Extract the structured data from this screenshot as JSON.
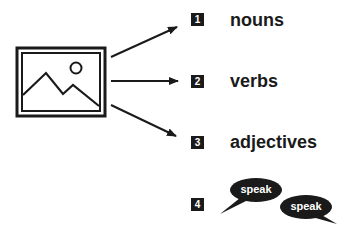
{
  "image_icon": "picture-icon",
  "items": [
    {
      "number": "1",
      "label": "nouns"
    },
    {
      "number": "2",
      "label": "verbs"
    },
    {
      "number": "3",
      "label": "adjectives"
    },
    {
      "number": "4",
      "bubbles": [
        "speak",
        "speak"
      ]
    }
  ],
  "colors": {
    "ink": "#1a1a1a",
    "background": "#ffffff"
  }
}
